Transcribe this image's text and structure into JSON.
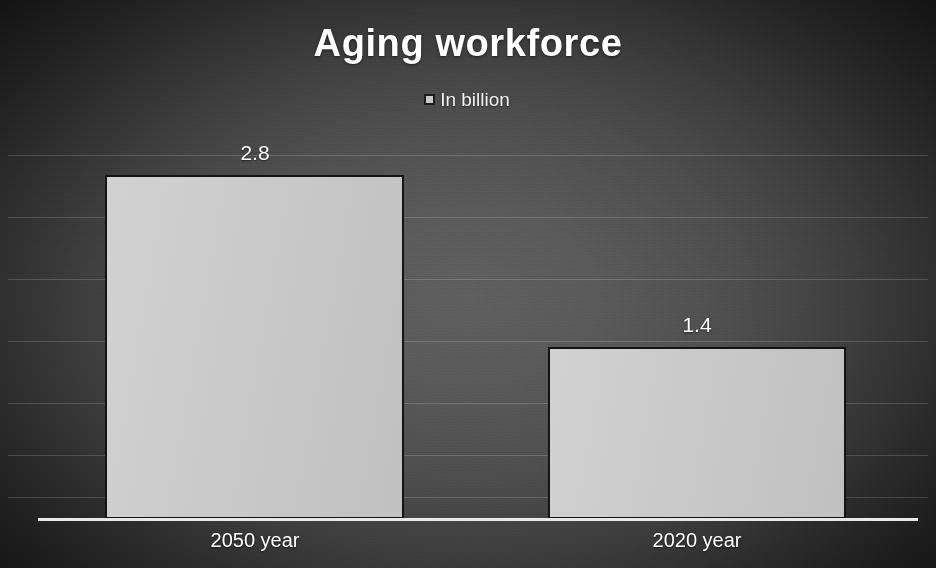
{
  "chart_data": {
    "type": "bar",
    "title": "Aging workforce",
    "xlabel": "",
    "ylabel": "",
    "categories": [
      "2050 year",
      "2020 year"
    ],
    "values": [
      2.8,
      1.4
    ],
    "value_labels": [
      "2.8",
      "1.4"
    ],
    "series": [
      {
        "name": "In billion",
        "values": [
          2.8,
          1.4
        ],
        "color": "#c9c9c9"
      }
    ],
    "legend": {
      "position": "top-center",
      "entries": [
        {
          "label": "In billion",
          "swatch_color": "#c9c9c9",
          "swatch_icon": "square-marker-icon"
        }
      ]
    },
    "ylim": [
      0,
      3.2
    ],
    "grid": true,
    "gridline_values": [
      2.8,
      2.4,
      2.0,
      1.6,
      1.2,
      0.8,
      0.4
    ],
    "axis_tick_labels_visible": false,
    "background": {
      "style": "radial-vignette",
      "center_color": "#5e5e5e",
      "edge_color": "#0b0b0b"
    },
    "text_color": "#ffffff",
    "bar_border_color": "#141414",
    "axis_line_color": "#e8e8e8"
  }
}
